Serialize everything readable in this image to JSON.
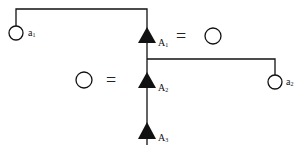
{
  "diagram": {
    "type": "pedigree-tree",
    "nodes": {
      "a1": {
        "label": "a",
        "subscript": "1",
        "shape": "circle-open"
      },
      "a2": {
        "label": "a",
        "subscript": "2",
        "shape": "circle-open"
      },
      "A1": {
        "label": "A",
        "subscript": "1",
        "shape": "triangle-filled"
      },
      "A2": {
        "label": "A",
        "subscript": "2",
        "shape": "triangle-filled"
      },
      "A3": {
        "label": "A",
        "subscript": "3",
        "shape": "triangle-filled"
      }
    },
    "equations": [
      {
        "left": "A1",
        "symbol": "=",
        "right": "circle-open"
      },
      {
        "left": "circle-open",
        "symbol": "=",
        "right": "A2"
      }
    ],
    "edges": [
      [
        "A1",
        "a1"
      ],
      [
        "A1",
        "A2"
      ],
      [
        "A1",
        "a2"
      ],
      [
        "A2",
        "A3"
      ]
    ],
    "colors": {
      "line": "#111111",
      "fill": "#111111",
      "background": "#ffffff"
    }
  }
}
